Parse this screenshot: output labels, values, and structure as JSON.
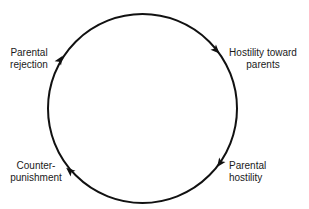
{
  "diagram": {
    "type": "cycle",
    "direction": "clockwise",
    "stroke_color": "#111111",
    "background": "#ffffff",
    "nodes": [
      {
        "id": "parental-rejection",
        "lines": [
          "Parental",
          "rejection"
        ]
      },
      {
        "id": "hostility-toward-parents",
        "lines": [
          "Hostility toward",
          "parents"
        ]
      },
      {
        "id": "parental-hostility",
        "lines": [
          "Parental",
          "hostility"
        ]
      },
      {
        "id": "counter-punishment",
        "lines": [
          "Counter-",
          "punishment"
        ]
      }
    ],
    "edges": [
      {
        "from": "parental-rejection",
        "to": "hostility-toward-parents"
      },
      {
        "from": "hostility-toward-parents",
        "to": "parental-hostility"
      },
      {
        "from": "parental-hostility",
        "to": "counter-punishment"
      },
      {
        "from": "counter-punishment",
        "to": "parental-rejection"
      }
    ]
  }
}
